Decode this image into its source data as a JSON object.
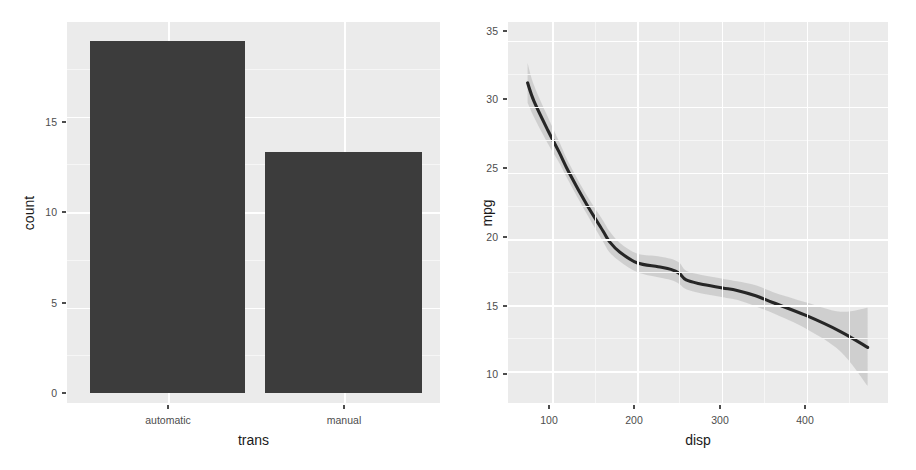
{
  "figure": {
    "width": 916,
    "height": 470,
    "background": "#ffffff",
    "panel_background": "#ebebeb",
    "gridline_color": "#ffffff",
    "bar_fill": "#3c3c3c",
    "ribbon_fill": "#bfbfbf",
    "line_color": "#262626",
    "tick_text_color": "#4d4d4d",
    "axis_title_color": "#1a1a1a"
  },
  "chart_data": [
    {
      "type": "bar",
      "panel": "left",
      "title": "",
      "xlabel": "trans",
      "ylabel": "count",
      "categories": [
        "automatic",
        "manual"
      ],
      "values": [
        19,
        13
      ],
      "ylim": [
        0,
        19.95
      ],
      "y_ticks": [
        0,
        5,
        10,
        15
      ],
      "y_tick_labels": [
        "0",
        "5",
        "10",
        "15"
      ],
      "y_minor_ticks": [
        2.5,
        7.5,
        12.5,
        17.5
      ],
      "x_tick_labels": [
        "automatic",
        "manual"
      ],
      "grid": true,
      "legend": "none",
      "panel_px": {
        "left": 67,
        "right": 440,
        "top": 22,
        "bottom": 403
      },
      "bars_px": [
        {
          "x": 90,
          "width": 155,
          "top": 41,
          "bottom": 393
        },
        {
          "x": 265,
          "width": 157,
          "top": 152,
          "bottom": 393
        }
      ],
      "y_px": {
        "0": 393,
        "5": 303,
        "10": 212,
        "15": 122
      },
      "x_px": {
        "automatic": 168,
        "manual": 344
      }
    },
    {
      "type": "line",
      "panel": "right",
      "title": "",
      "xlabel": "disp",
      "ylabel": "mpg",
      "xlim": [
        48,
        496
      ],
      "ylim": [
        7.6,
        36.4
      ],
      "x_ticks": [
        100,
        200,
        300,
        400
      ],
      "x_tick_labels": [
        "100",
        "200",
        "300",
        "400"
      ],
      "y_ticks": [
        10,
        15,
        20,
        25,
        30,
        35
      ],
      "y_tick_labels": [
        "10",
        "15",
        "20",
        "25",
        "30",
        "35"
      ],
      "x_minor_ticks": [
        150,
        250,
        350,
        450
      ],
      "y_minor_ticks": [
        12.5,
        17.5,
        22.5,
        27.5,
        32.5
      ],
      "grid": true,
      "legend": "none",
      "series": [
        {
          "name": "loess fit",
          "x": [
            71.1,
            78.7,
            95.1,
            108.0,
            120.1,
            140.8,
            160.0,
            167.6,
            180.0,
            200.0,
            225.0,
            240.0,
            250.0,
            258.0,
            275.0,
            301.0,
            318.0,
            340.0,
            360.0,
            400.0,
            440.0,
            472.0
          ],
          "y": [
            31.8,
            30.4,
            28.2,
            26.6,
            25.0,
            22.6,
            20.6,
            19.8,
            19.0,
            18.2,
            17.9,
            17.7,
            17.4,
            16.9,
            16.6,
            16.3,
            16.1,
            15.7,
            15.2,
            14.2,
            13.0,
            11.8
          ],
          "ymin": [
            30.3,
            29.2,
            27.2,
            25.8,
            24.3,
            21.9,
            19.8,
            19.0,
            18.3,
            17.5,
            17.1,
            16.9,
            16.6,
            16.2,
            15.9,
            15.6,
            15.4,
            14.9,
            14.4,
            13.2,
            11.5,
            8.9
          ],
          "ymax": [
            33.3,
            31.6,
            29.2,
            27.4,
            25.7,
            23.3,
            21.4,
            20.6,
            19.7,
            18.9,
            18.7,
            18.5,
            18.2,
            17.6,
            17.3,
            17.0,
            16.8,
            16.5,
            16.0,
            15.2,
            14.5,
            14.8
          ]
        }
      ],
      "panel_px": {
        "left": 508,
        "right": 888,
        "top": 22,
        "bottom": 403
      },
      "y_px": {
        "10": 374,
        "15": 306,
        "20": 237,
        "25": 168,
        "30": 99,
        "35": 31
      },
      "x_px": {
        "100": 549,
        "200": 634,
        "300": 720,
        "400": 805
      }
    }
  ]
}
